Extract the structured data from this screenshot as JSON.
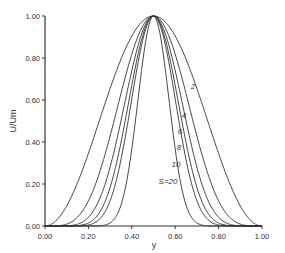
{
  "chart_data": {
    "type": "line",
    "title": "",
    "xlabel": "y",
    "ylabel": "U/Um",
    "xlim": [
      0,
      1
    ],
    "ylim": [
      0,
      1
    ],
    "xticks": [
      "0.00",
      "0.20",
      "0.40",
      "0.60",
      "0.80",
      "1.00"
    ],
    "yticks": [
      "0.00",
      "0.20",
      "0.40",
      "0.60",
      "0.80",
      "1.00"
    ],
    "grid": false,
    "legend": "inline labels on curves",
    "series": [
      {
        "name": "2",
        "exponent": 2,
        "label": "2"
      },
      {
        "name": "4",
        "exponent": 4,
        "label": "4"
      },
      {
        "name": "6",
        "exponent": 6,
        "label": "6"
      },
      {
        "name": "8",
        "exponent": 8,
        "label": "8"
      },
      {
        "name": "10",
        "exponent": 10,
        "label": "10"
      },
      {
        "name": "S=20",
        "exponent": 20,
        "label": "S=20"
      }
    ],
    "x": [
      0.0,
      0.1,
      0.2,
      0.3,
      0.4,
      0.5,
      0.6,
      0.7,
      0.8,
      0.9,
      1.0
    ],
    "values": {
      "2": [
        0.0,
        0.1,
        0.35,
        0.65,
        0.9,
        1.0,
        0.9,
        0.65,
        0.35,
        0.1,
        0.0
      ],
      "4": [
        0.0,
        0.01,
        0.12,
        0.43,
        0.82,
        1.0,
        0.82,
        0.43,
        0.12,
        0.01,
        0.0
      ],
      "6": [
        0.0,
        0.0,
        0.04,
        0.28,
        0.74,
        1.0,
        0.74,
        0.28,
        0.04,
        0.0,
        0.0
      ],
      "8": [
        0.0,
        0.0,
        0.01,
        0.18,
        0.67,
        1.0,
        0.67,
        0.18,
        0.01,
        0.0,
        0.0
      ],
      "10": [
        0.0,
        0.0,
        0.0,
        0.12,
        0.61,
        1.0,
        0.61,
        0.12,
        0.0,
        0.0,
        0.0
      ],
      "S=20": [
        0.0,
        0.0,
        0.0,
        0.01,
        0.37,
        1.0,
        0.37,
        0.01,
        0.0,
        0.0,
        0.0
      ]
    }
  },
  "labels": {
    "xlabel": "y",
    "ylabel": "U/Um",
    "curve_labels": [
      "2",
      "4",
      "6",
      "8",
      "10",
      "S=20"
    ]
  }
}
